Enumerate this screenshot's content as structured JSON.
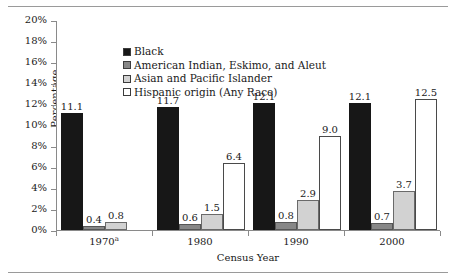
{
  "chart_data": {
    "type": "bar",
    "title": "",
    "xlabel": "Census Year",
    "ylabel": "Percentage",
    "categories": [
      "1970a",
      "1980",
      "1990",
      "2000"
    ],
    "category_labels": [
      "1970",
      "1980",
      "1990",
      "2000"
    ],
    "category_superscripts": [
      "a",
      "",
      "",
      ""
    ],
    "ylim": [
      0,
      20
    ],
    "yticks": [
      0,
      2,
      4,
      6,
      8,
      10,
      12,
      14,
      16,
      18,
      20
    ],
    "ytick_labels": [
      "0%",
      "2%",
      "4%",
      "6%",
      "8%",
      "10%",
      "12%",
      "14%",
      "16%",
      "18%",
      "20%"
    ],
    "grid": false,
    "legend_position": "top-left inside plot",
    "series": [
      {
        "name": "Black",
        "color": "#171717",
        "values": [
          11.1,
          11.7,
          12.1,
          12.1
        ],
        "labels": [
          "11.1",
          "11.7",
          "12.1",
          "12.1"
        ]
      },
      {
        "name": "American Indian, Eskimo, and Aleut",
        "color": "#878787",
        "values": [
          0.4,
          0.6,
          0.8,
          0.7
        ],
        "labels": [
          "0.4",
          "0.6",
          "0.8",
          "0.7"
        ]
      },
      {
        "name": "Asian and Pacific Islander",
        "color": "#d2d2d2",
        "values": [
          0.8,
          1.5,
          2.9,
          3.7
        ],
        "labels": [
          "0.8",
          "1.5",
          "2.9",
          "3.7"
        ]
      },
      {
        "name": "Hispanic origin (Any Race)",
        "color": "#ffffff",
        "values": [
          null,
          6.4,
          9.0,
          12.5
        ],
        "labels": [
          "",
          "6.4",
          "9.0",
          "12.5"
        ]
      }
    ]
  },
  "axes": {
    "y_title": "Percentage",
    "x_title": "Census Year"
  }
}
